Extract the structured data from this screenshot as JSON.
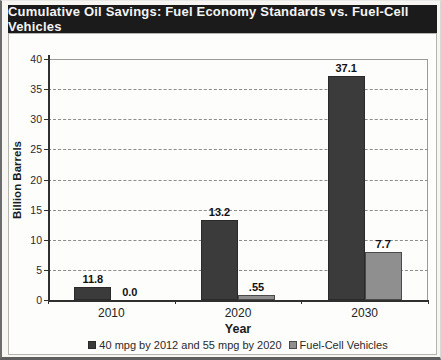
{
  "header": {
    "title": "Cumulative Oil Savings: Fuel Economy Standards vs. Fuel-Cell Vehicles"
  },
  "chart_data": {
    "type": "bar",
    "title": "Cumulative Oil Savings: Fuel Economy Standards vs. Fuel-Cell Vehicles",
    "categories": [
      "2010",
      "2020",
      "2030"
    ],
    "series": [
      {
        "name": "40 mpg by 2012 and 55 mpg by 2020",
        "values": [
          11.8,
          13.2,
          37.1
        ],
        "data_labels": [
          "11.8",
          "13.2",
          "37.1"
        ],
        "drawn_values": [
          2.2,
          13.2,
          37.1
        ],
        "color": "#3b3b3b",
        "border_color": "#2a2a2a"
      },
      {
        "name": "Fuel-Cell Vehicles",
        "values": [
          0.0,
          0.55,
          7.7
        ],
        "data_labels": [
          "0.0",
          ".55",
          "7.7"
        ],
        "drawn_values": [
          0,
          0.8,
          8.0
        ],
        "color": "#8f8f8f",
        "border_color": "#4a4a4a"
      }
    ],
    "xlabel": "Year",
    "ylabel": "Billion Barrels",
    "ylim": [
      0,
      40
    ],
    "yticks": [
      0,
      5,
      10,
      15,
      20,
      25,
      30,
      35,
      40
    ],
    "grid": {
      "horizontal": true,
      "style": "dashed",
      "color": "#8c8c8c"
    },
    "legend_position": "bottom"
  },
  "colors": {
    "title_bar_bg": "#1b1b1b",
    "title_bar_text": "#f4f4f4",
    "axis": "#2f2f2f",
    "gridline": "#8c8c8c"
  }
}
